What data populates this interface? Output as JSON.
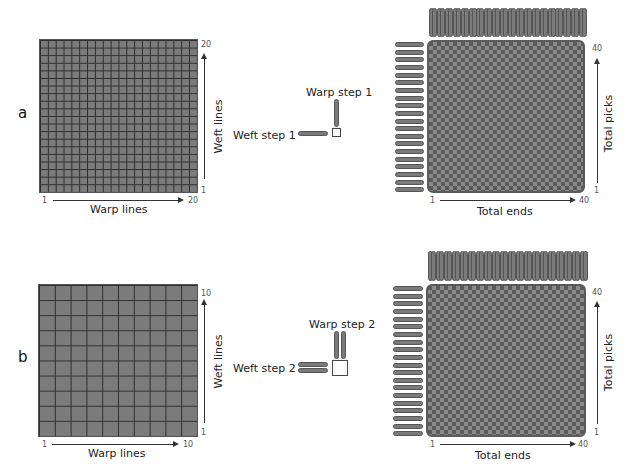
{
  "panels": [
    {
      "id": "a",
      "label": "a",
      "grid": {
        "cells": 20,
        "x_axis_label": "Warp lines",
        "y_axis_label": "Weft lines",
        "x_start": "1",
        "x_end": "20",
        "y_start": "1",
        "y_end": "20"
      },
      "step": {
        "warp_label": "Warp step 1",
        "weft_label": "Weft step 1",
        "yarn_count": 1
      },
      "fabric": {
        "x_axis_label": "Total ends",
        "y_axis_label": "Total picks",
        "x_start": "1",
        "x_end": "40",
        "y_start": "1",
        "y_end": "40",
        "warp_yarns_top": 20,
        "weft_yarns_left": 20
      }
    },
    {
      "id": "b",
      "label": "b",
      "grid": {
        "cells": 10,
        "x_axis_label": "Warp lines",
        "y_axis_label": "Weft lines",
        "x_start": "1",
        "x_end": "10",
        "y_start": "1",
        "y_end": "10"
      },
      "step": {
        "warp_label": "Warp step 2",
        "weft_label": "Weft step 2",
        "yarn_count": 2
      },
      "fabric": {
        "x_axis_label": "Total ends",
        "y_axis_label": "Total picks",
        "x_start": "1",
        "x_end": "40",
        "y_start": "1",
        "y_end": "40",
        "warp_yarns_top": 20,
        "weft_yarns_left": 20
      }
    }
  ],
  "colors": {
    "grid_fill": "#7b7b7b",
    "grid_line": "#2e2e2e",
    "yarn_fill": "#7a7a7a",
    "yarn_edge": "#555555",
    "fabric_dark": "#5a5a5a"
  }
}
